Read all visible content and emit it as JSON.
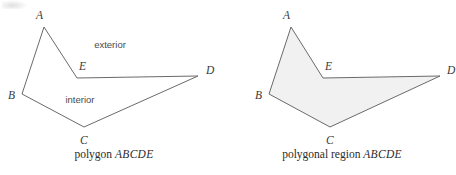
{
  "figure": {
    "stroke_color": "#6a6a6a",
    "fill_color": "#f1f1f1",
    "label_color": "#3a3a3a",
    "panels": [
      {
        "id": "polygon-outline",
        "caption_prefix": "polygon ",
        "caption_name": "ABCDE",
        "filled": false,
        "vertices": [
          {
            "name": "A",
            "x": 44,
            "y": 27,
            "label_x": 36,
            "label_y": 19
          },
          {
            "name": "B",
            "x": 22,
            "y": 94,
            "label_x": 8,
            "label_y": 99
          },
          {
            "name": "C",
            "x": 84,
            "y": 127,
            "label_x": 80,
            "label_y": 144
          },
          {
            "name": "D",
            "x": 198,
            "y": 76,
            "label_x": 206,
            "label_y": 74
          },
          {
            "name": "E",
            "x": 77,
            "y": 78,
            "label_x": 79,
            "label_y": 70
          }
        ],
        "region_labels": [
          {
            "text": "exterior",
            "x": 110,
            "y": 48
          },
          {
            "text": "interior",
            "x": 80,
            "y": 103
          }
        ]
      },
      {
        "id": "polygonal-region",
        "caption_prefix": "polygonal region ",
        "caption_name": "ABCDE",
        "filled": true,
        "vertices": [
          {
            "name": "A",
            "x": 63,
            "y": 27,
            "label_x": 55,
            "label_y": 19
          },
          {
            "name": "B",
            "x": 41,
            "y": 94,
            "label_x": 27,
            "label_y": 99
          },
          {
            "name": "C",
            "x": 102,
            "y": 127,
            "label_x": 98,
            "label_y": 144
          },
          {
            "name": "D",
            "x": 212,
            "y": 76,
            "label_x": 219,
            "label_y": 74
          },
          {
            "name": "E",
            "x": 95,
            "y": 78,
            "label_x": 97,
            "label_y": 70
          }
        ],
        "region_labels": []
      }
    ]
  }
}
